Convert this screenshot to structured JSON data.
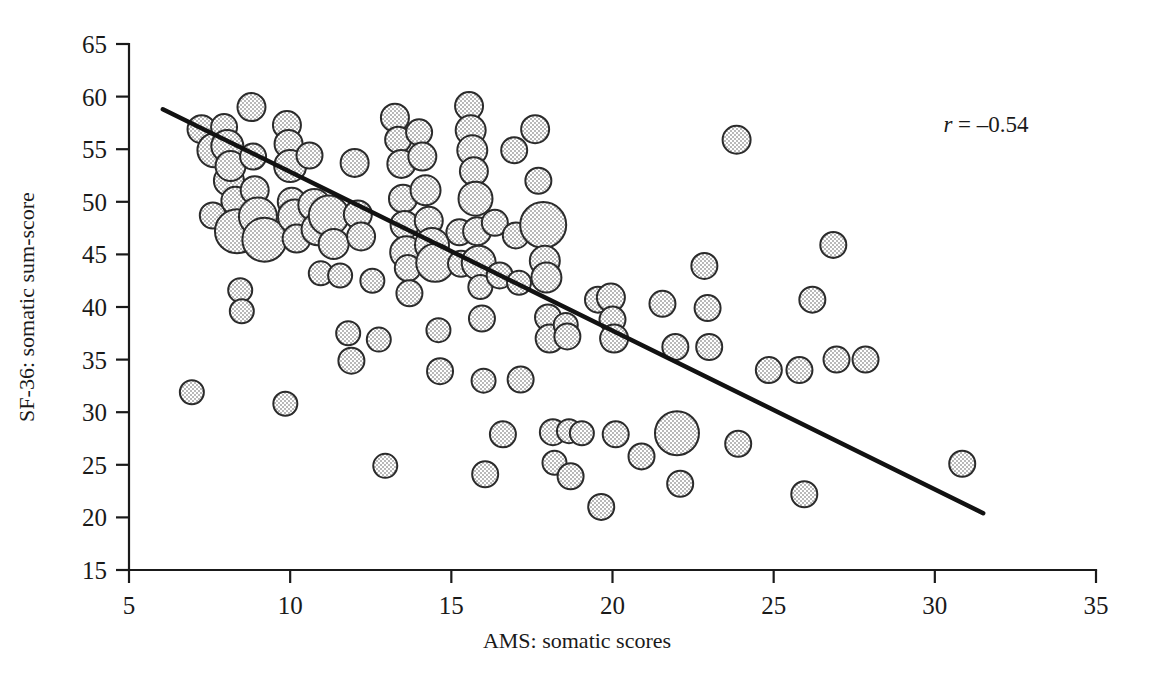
{
  "chart_data": {
    "type": "scatter",
    "title": "",
    "subtitle": "",
    "xlabel": "AMS: somatic scores",
    "ylabel": "SF-36: somatic sum-score",
    "xlim": [
      5,
      35
    ],
    "ylim": [
      15,
      65
    ],
    "xticks": [
      5,
      10,
      15,
      20,
      25,
      30,
      35
    ],
    "yticks": [
      15,
      20,
      25,
      30,
      35,
      40,
      45,
      50,
      55,
      60,
      65
    ],
    "xtick_labels": [
      "5",
      "10",
      "15",
      "20",
      "25",
      "30",
      "35"
    ],
    "ytick_labels": [
      "15",
      "20",
      "25",
      "30",
      "35",
      "40",
      "45",
      "50",
      "55",
      "60",
      "65"
    ],
    "grid": false,
    "legend": false,
    "legend_position": "none",
    "marker": {
      "shape": "circle",
      "fill_color": "#d9d9d9",
      "fill_pattern": "dither-checkerboard",
      "edge_color": "#2b2b2b",
      "size_encodes": "count of overlapping observations"
    },
    "annotations": [
      {
        "name": "correlation",
        "text_italic": "r",
        "text_rest": " = –0.54",
        "full_text": "r = –0.54",
        "x": 29.8,
        "y": 62.0
      }
    ],
    "trend_line": {
      "type": "linear-fit",
      "color": "#121212",
      "x_start": 6.05,
      "y_start": 58.8,
      "x_end": 31.5,
      "y_end": 20.4
    },
    "points": [
      {
        "x": 6.95,
        "y": 31.9,
        "r": 12
      },
      {
        "x": 7.25,
        "y": 56.9,
        "r": 14
      },
      {
        "x": 7.65,
        "y": 54.9,
        "r": 17
      },
      {
        "x": 7.6,
        "y": 48.7,
        "r": 13
      },
      {
        "x": 7.95,
        "y": 57.1,
        "r": 13
      },
      {
        "x": 8.05,
        "y": 55.3,
        "r": 16
      },
      {
        "x": 8.1,
        "y": 52.0,
        "r": 15
      },
      {
        "x": 8.15,
        "y": 53.4,
        "r": 15
      },
      {
        "x": 8.3,
        "y": 50.1,
        "r": 14
      },
      {
        "x": 8.35,
        "y": 47.2,
        "r": 22
      },
      {
        "x": 8.45,
        "y": 41.6,
        "r": 12
      },
      {
        "x": 8.5,
        "y": 39.6,
        "r": 12
      },
      {
        "x": 8.8,
        "y": 59.0,
        "r": 14
      },
      {
        "x": 8.85,
        "y": 54.3,
        "r": 13
      },
      {
        "x": 8.9,
        "y": 51.1,
        "r": 14
      },
      {
        "x": 9.0,
        "y": 48.6,
        "r": 19
      },
      {
        "x": 9.2,
        "y": 46.4,
        "r": 22
      },
      {
        "x": 9.85,
        "y": 30.8,
        "r": 12
      },
      {
        "x": 9.9,
        "y": 57.3,
        "r": 14
      },
      {
        "x": 9.95,
        "y": 55.5,
        "r": 14
      },
      {
        "x": 10.0,
        "y": 53.4,
        "r": 16
      },
      {
        "x": 10.05,
        "y": 50.0,
        "r": 14
      },
      {
        "x": 10.15,
        "y": 48.6,
        "r": 17
      },
      {
        "x": 10.2,
        "y": 46.5,
        "r": 14
      },
      {
        "x": 10.6,
        "y": 54.4,
        "r": 13
      },
      {
        "x": 10.75,
        "y": 49.7,
        "r": 16
      },
      {
        "x": 10.85,
        "y": 47.4,
        "r": 16
      },
      {
        "x": 10.95,
        "y": 43.2,
        "r": 12
      },
      {
        "x": 11.2,
        "y": 48.7,
        "r": 20
      },
      {
        "x": 11.35,
        "y": 46.0,
        "r": 15
      },
      {
        "x": 11.55,
        "y": 43.0,
        "r": 12
      },
      {
        "x": 11.8,
        "y": 37.5,
        "r": 12
      },
      {
        "x": 11.9,
        "y": 34.9,
        "r": 13
      },
      {
        "x": 12.0,
        "y": 53.7,
        "r": 14
      },
      {
        "x": 12.1,
        "y": 48.8,
        "r": 14
      },
      {
        "x": 12.2,
        "y": 46.7,
        "r": 14
      },
      {
        "x": 12.55,
        "y": 42.5,
        "r": 12
      },
      {
        "x": 12.75,
        "y": 36.9,
        "r": 12
      },
      {
        "x": 12.95,
        "y": 24.9,
        "r": 12
      },
      {
        "x": 13.25,
        "y": 58.0,
        "r": 14
      },
      {
        "x": 13.35,
        "y": 55.9,
        "r": 13
      },
      {
        "x": 13.45,
        "y": 53.6,
        "r": 14
      },
      {
        "x": 13.5,
        "y": 50.3,
        "r": 14
      },
      {
        "x": 13.55,
        "y": 47.8,
        "r": 14
      },
      {
        "x": 13.6,
        "y": 45.2,
        "r": 16
      },
      {
        "x": 13.65,
        "y": 43.7,
        "r": 13
      },
      {
        "x": 13.7,
        "y": 41.3,
        "r": 13
      },
      {
        "x": 14.0,
        "y": 56.6,
        "r": 13
      },
      {
        "x": 14.1,
        "y": 54.3,
        "r": 14
      },
      {
        "x": 14.2,
        "y": 51.1,
        "r": 15
      },
      {
        "x": 14.3,
        "y": 48.2,
        "r": 14
      },
      {
        "x": 14.4,
        "y": 45.9,
        "r": 17
      },
      {
        "x": 14.5,
        "y": 44.2,
        "r": 19
      },
      {
        "x": 14.6,
        "y": 37.8,
        "r": 12
      },
      {
        "x": 14.65,
        "y": 33.9,
        "r": 13
      },
      {
        "x": 15.25,
        "y": 47.1,
        "r": 13
      },
      {
        "x": 15.3,
        "y": 44.1,
        "r": 13
      },
      {
        "x": 15.55,
        "y": 59.1,
        "r": 14
      },
      {
        "x": 15.6,
        "y": 56.8,
        "r": 15
      },
      {
        "x": 15.65,
        "y": 54.9,
        "r": 15
      },
      {
        "x": 15.7,
        "y": 52.9,
        "r": 14
      },
      {
        "x": 15.75,
        "y": 50.3,
        "r": 17
      },
      {
        "x": 15.8,
        "y": 47.2,
        "r": 14
      },
      {
        "x": 15.85,
        "y": 44.2,
        "r": 17
      },
      {
        "x": 15.9,
        "y": 41.9,
        "r": 12
      },
      {
        "x": 15.95,
        "y": 38.9,
        "r": 13
      },
      {
        "x": 16.0,
        "y": 33.0,
        "r": 12
      },
      {
        "x": 16.05,
        "y": 24.1,
        "r": 13
      },
      {
        "x": 16.35,
        "y": 48.0,
        "r": 13
      },
      {
        "x": 16.5,
        "y": 43.0,
        "r": 13
      },
      {
        "x": 16.6,
        "y": 27.9,
        "r": 13
      },
      {
        "x": 16.95,
        "y": 54.9,
        "r": 13
      },
      {
        "x": 17.0,
        "y": 46.8,
        "r": 13
      },
      {
        "x": 17.1,
        "y": 42.3,
        "r": 12
      },
      {
        "x": 17.15,
        "y": 33.1,
        "r": 13
      },
      {
        "x": 17.6,
        "y": 56.9,
        "r": 14
      },
      {
        "x": 17.7,
        "y": 52.0,
        "r": 13
      },
      {
        "x": 17.85,
        "y": 47.8,
        "r": 23
      },
      {
        "x": 17.9,
        "y": 44.4,
        "r": 15
      },
      {
        "x": 17.95,
        "y": 42.8,
        "r": 15
      },
      {
        "x": 18.0,
        "y": 39.0,
        "r": 13
      },
      {
        "x": 18.05,
        "y": 37.0,
        "r": 14
      },
      {
        "x": 18.15,
        "y": 28.1,
        "r": 13
      },
      {
        "x": 18.2,
        "y": 25.2,
        "r": 12
      },
      {
        "x": 18.55,
        "y": 38.3,
        "r": 12
      },
      {
        "x": 18.6,
        "y": 37.2,
        "r": 13
      },
      {
        "x": 18.65,
        "y": 28.2,
        "r": 12
      },
      {
        "x": 18.7,
        "y": 23.9,
        "r": 13
      },
      {
        "x": 19.05,
        "y": 28.0,
        "r": 12
      },
      {
        "x": 19.55,
        "y": 40.7,
        "r": 13
      },
      {
        "x": 19.65,
        "y": 21.0,
        "r": 13
      },
      {
        "x": 19.95,
        "y": 40.9,
        "r": 14
      },
      {
        "x": 20.0,
        "y": 38.8,
        "r": 13
      },
      {
        "x": 20.05,
        "y": 37.0,
        "r": 14
      },
      {
        "x": 20.1,
        "y": 27.9,
        "r": 13
      },
      {
        "x": 20.9,
        "y": 25.8,
        "r": 13
      },
      {
        "x": 21.55,
        "y": 40.3,
        "r": 13
      },
      {
        "x": 21.95,
        "y": 36.2,
        "r": 13
      },
      {
        "x": 22.0,
        "y": 28.0,
        "r": 22
      },
      {
        "x": 22.1,
        "y": 23.2,
        "r": 13
      },
      {
        "x": 22.85,
        "y": 43.9,
        "r": 13
      },
      {
        "x": 22.95,
        "y": 39.9,
        "r": 13
      },
      {
        "x": 23.0,
        "y": 36.2,
        "r": 13
      },
      {
        "x": 23.85,
        "y": 55.9,
        "r": 14
      },
      {
        "x": 23.9,
        "y": 27.0,
        "r": 13
      },
      {
        "x": 24.85,
        "y": 34.0,
        "r": 13
      },
      {
        "x": 25.8,
        "y": 34.0,
        "r": 13
      },
      {
        "x": 25.95,
        "y": 22.2,
        "r": 13
      },
      {
        "x": 26.2,
        "y": 40.7,
        "r": 13
      },
      {
        "x": 26.85,
        "y": 45.9,
        "r": 13
      },
      {
        "x": 26.95,
        "y": 35.0,
        "r": 13
      },
      {
        "x": 27.85,
        "y": 35.0,
        "r": 13
      },
      {
        "x": 30.85,
        "y": 25.1,
        "r": 13
      }
    ]
  },
  "axes": {
    "x_title": "AMS: somatic scores",
    "y_title": "SF-36: somatic sum-score"
  },
  "annotation": {
    "r_symbol": "r",
    "r_value": " = –0.54"
  }
}
